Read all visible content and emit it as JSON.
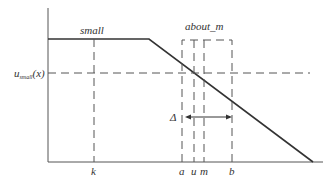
{
  "diagram": {
    "labels": {
      "small": "small",
      "about_m": "about_m",
      "y_value_main": "u",
      "y_value_sub": "small",
      "y_value_arg": "(x)",
      "delta": "Δ",
      "k": "k",
      "a": "a",
      "u": "u",
      "m": "m",
      "b": "b"
    },
    "colors": {
      "line": "#333333",
      "axis": "#555555",
      "dashed": "#555555",
      "background": "#ffffff"
    }
  }
}
